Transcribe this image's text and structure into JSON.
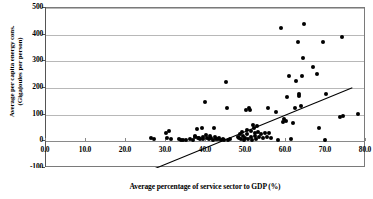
{
  "chart_data": {
    "type": "scatter",
    "title": "",
    "xlabel": "Average percentage of service sector to GDP (%)",
    "ylabel": "Average per capita energy cons. (Gigajoules per person)",
    "ylabel_line1": "Average per capita energy cons.",
    "ylabel_line2": "(Gigajoules per person)",
    "xlim": [
      0.0,
      80.0
    ],
    "ylim": [
      -100,
      500
    ],
    "xticks": [
      "0.0",
      "10.0",
      "20.0",
      "30.0",
      "40.0",
      "50.0",
      "60.0",
      "70.0",
      "80.0"
    ],
    "xtick_values": [
      0,
      10,
      20,
      30,
      40,
      50,
      60,
      70,
      80
    ],
    "yticks": [
      "-100",
      "0",
      "100",
      "200",
      "300",
      "400",
      "500"
    ],
    "ytick_values": [
      -100,
      0,
      100,
      200,
      300,
      400,
      500
    ],
    "grid": "horizontal",
    "legend": "none",
    "marker": "filled-circle",
    "marker_color": "#000000",
    "points": [
      [
        26.5,
        8
      ],
      [
        27.3,
        6
      ],
      [
        30.3,
        28
      ],
      [
        30.6,
        10
      ],
      [
        31.0,
        35
      ],
      [
        31.5,
        5
      ],
      [
        33.6,
        4
      ],
      [
        34.0,
        3
      ],
      [
        34.5,
        2
      ],
      [
        35.3,
        2
      ],
      [
        36.3,
        6
      ],
      [
        37.0,
        3
      ],
      [
        37.4,
        12
      ],
      [
        37.6,
        18
      ],
      [
        38.0,
        42
      ],
      [
        38.2,
        8
      ],
      [
        38.4,
        10
      ],
      [
        38.8,
        5
      ],
      [
        39.2,
        45
      ],
      [
        39.4,
        14
      ],
      [
        39.6,
        6
      ],
      [
        39.9,
        142
      ],
      [
        40.2,
        20
      ],
      [
        40.6,
        8
      ],
      [
        40.9,
        4
      ],
      [
        41.3,
        16
      ],
      [
        41.6,
        8
      ],
      [
        41.9,
        3
      ],
      [
        42.2,
        48
      ],
      [
        42.5,
        14
      ],
      [
        42.8,
        6
      ],
      [
        43.2,
        4
      ],
      [
        43.6,
        10
      ],
      [
        44.0,
        2
      ],
      [
        44.4,
        6
      ],
      [
        44.8,
        3
      ],
      [
        45.2,
        220
      ],
      [
        45.4,
        121
      ],
      [
        45.8,
        2
      ],
      [
        46.2,
        4
      ],
      [
        48.2,
        14
      ],
      [
        48.5,
        8
      ],
      [
        48.7,
        22
      ],
      [
        48.9,
        4
      ],
      [
        49.2,
        30
      ],
      [
        49.5,
        18
      ],
      [
        49.7,
        2
      ],
      [
        49.9,
        10
      ],
      [
        50.2,
        112
      ],
      [
        50.4,
        40
      ],
      [
        50.6,
        24
      ],
      [
        50.8,
        6
      ],
      [
        51.0,
        122
      ],
      [
        51.2,
        114
      ],
      [
        51.4,
        36
      ],
      [
        51.6,
        14
      ],
      [
        51.8,
        2
      ],
      [
        52.0,
        58
      ],
      [
        52.2,
        48
      ],
      [
        52.4,
        28
      ],
      [
        52.6,
        16
      ],
      [
        52.8,
        4
      ],
      [
        53.0,
        52
      ],
      [
        53.2,
        30
      ],
      [
        53.4,
        12
      ],
      [
        54.0,
        22
      ],
      [
        54.4,
        8
      ],
      [
        55.0,
        28
      ],
      [
        55.4,
        14
      ],
      [
        55.8,
        122
      ],
      [
        56.0,
        26
      ],
      [
        56.4,
        10
      ],
      [
        57.8,
        108
      ],
      [
        58.2,
        2
      ],
      [
        58.9,
        420
      ],
      [
        59.4,
        70
      ],
      [
        59.8,
        80
      ],
      [
        60.2,
        72
      ],
      [
        60.6,
        164
      ],
      [
        61.0,
        240
      ],
      [
        61.4,
        6
      ],
      [
        62.0,
        64
      ],
      [
        62.4,
        120
      ],
      [
        62.8,
        222
      ],
      [
        63.2,
        368
      ],
      [
        63.4,
        172
      ],
      [
        63.6,
        168
      ],
      [
        63.9,
        130
      ],
      [
        64.2,
        240
      ],
      [
        64.5,
        308
      ],
      [
        64.8,
        438
      ],
      [
        67.0,
        276
      ],
      [
        68.0,
        248
      ],
      [
        68.4,
        46
      ],
      [
        69.6,
        368
      ],
      [
        69.9,
        2
      ],
      [
        70.2,
        174
      ],
      [
        73.8,
        86
      ],
      [
        74.2,
        388
      ],
      [
        74.6,
        92
      ],
      [
        78.2,
        98
      ]
    ],
    "trendline": {
      "x1": 27.5,
      "y1": -105,
      "x2": 76.8,
      "y2": 198,
      "color": "#000000"
    }
  }
}
